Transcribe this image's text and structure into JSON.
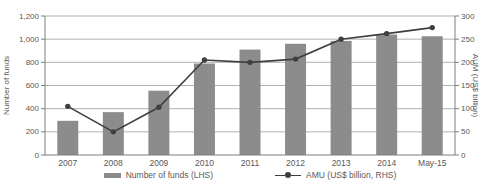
{
  "colors": {
    "bar": "#8c8c8c",
    "line": "#3f3f3f",
    "grid": "#a8a8a8",
    "axis": "#7f7f7f",
    "text": "#595959"
  },
  "chart_data": {
    "type": "bar",
    "subtype": "combo-bar-line",
    "categories": [
      "2007",
      "2008",
      "2009",
      "2010",
      "2011",
      "2012",
      "2013",
      "2014",
      "May-15"
    ],
    "series": [
      {
        "name": "Number of funds (LHS)",
        "type": "bar",
        "axis": "left",
        "values": [
          295,
          370,
          555,
          790,
          910,
          960,
          985,
          1040,
          1025
        ]
      },
      {
        "name": "AMU (US$ billion, RHS)",
        "type": "line",
        "axis": "right",
        "values": [
          105,
          50,
          103,
          205,
          200,
          207,
          250,
          262,
          275
        ]
      }
    ],
    "left_axis": {
      "label": "Number of funds",
      "min": 0,
      "max": 1200,
      "tick_values": [
        0,
        200,
        400,
        600,
        800,
        1000,
        1200
      ],
      "tick_labels": [
        "0",
        "200",
        "400",
        "600",
        "800",
        "1,000",
        "1,200"
      ]
    },
    "right_axis": {
      "label": "AUM (US$ billion)",
      "min": 0,
      "max": 300,
      "tick_values": [
        0,
        50,
        100,
        150,
        200,
        250,
        300
      ],
      "tick_labels": [
        "0",
        "50",
        "100",
        "150",
        "200",
        "250",
        "300"
      ]
    },
    "grid": true,
    "legend_position": "bottom"
  }
}
